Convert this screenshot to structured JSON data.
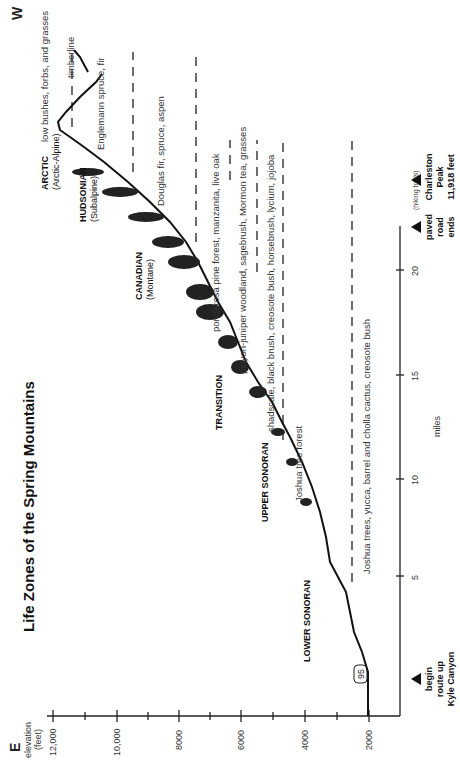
{
  "diagram": {
    "title": "Life Zones of the Spring Mountains",
    "direction_left": "E",
    "direction_right": "W",
    "orientation": "rotated 90 degrees counterclockwise on page",
    "y_axis": {
      "label_line1": "elevation",
      "label_line2": "(feet)",
      "ticks": [
        "12,000",
        "10,000",
        "8000",
        "6000",
        "4000",
        "2000"
      ]
    },
    "x_axis": {
      "label": "miles",
      "ticks": [
        "5",
        "10",
        "15",
        "20"
      ]
    },
    "markers": [
      {
        "id": "begin",
        "lines": [
          "begin",
          "route up",
          "Kyle Canyon"
        ]
      },
      {
        "id": "paved-end",
        "lines": [
          "paved",
          "road",
          "ends"
        ]
      },
      {
        "id": "peak",
        "lines": [
          "Charleston",
          "Peak",
          "11,918 feet"
        ]
      }
    ],
    "hiking_trails_label": "(hiking trails)",
    "highway_shield": "95",
    "zones": [
      {
        "name": "LOWER SONORAN",
        "sub": ""
      },
      {
        "name": "UPPER SONORAN",
        "sub": ""
      },
      {
        "name": "TRANSITION",
        "sub": ""
      },
      {
        "name": "CANADIAN",
        "sub": "(Montane)"
      },
      {
        "name": "HUDSONIAN",
        "sub": "(Subalpine)"
      },
      {
        "name": "ARCTIC",
        "sub": "(Arctic-Alpine)"
      }
    ],
    "vegetation": [
      "Joshua trees, yucca, barrel and cholla cactus, creosote bush",
      "Joshua tree forest",
      "shadscale, black brush, creosote bush, horsebrush, lycium, jojoba",
      "pinyon-juniper woodland, sagebrush, Mormon tea, grasses",
      "ponderosa pine forest, manzanita, live oak",
      "Douglas fir, spruce, aspen",
      "Englemann spruce, fir",
      "low bushes, forbs, and grasses",
      "timberline"
    ]
  }
}
